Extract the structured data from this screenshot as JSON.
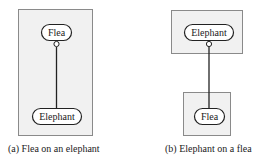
{
  "colors": {
    "box_fill": "#f1f1f1",
    "box_stroke": "#8a8a8a",
    "pill_fill": "#ffffff",
    "pill_stroke": "#222222",
    "line": "#222222"
  },
  "panels": [
    {
      "id": "a",
      "caption": "(a) Flea on an elephant",
      "top_node": "Flea",
      "bottom_node": "Elephant"
    },
    {
      "id": "b",
      "caption": "(b) Elephant on a flea",
      "top_node": "Elephant",
      "bottom_node": "Flea"
    }
  ]
}
